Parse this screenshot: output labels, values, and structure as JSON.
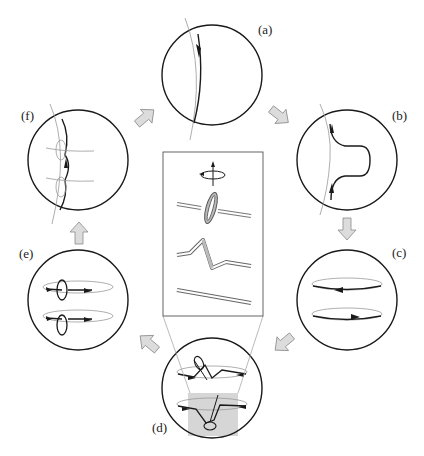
{
  "figure": {
    "type": "cyclic-process-diagram",
    "panels": [
      {
        "id": "a",
        "label": "(a)",
        "content": "field line with upward arrow crossing circle"
      },
      {
        "id": "b",
        "label": "(b)",
        "content": "field line deformed into omega loop with arrows"
      },
      {
        "id": "c",
        "label": "(c)",
        "content": "two horizontal toroidal loops with opposite arrows"
      },
      {
        "id": "d",
        "label": "(d)",
        "content": "toroidal loops with twisted kinks; highlighted gray region"
      },
      {
        "id": "e",
        "label": "(e)",
        "content": "toroidal loops with small poloidal loops"
      },
      {
        "id": "f",
        "label": "(f)",
        "content": "regenerated poloidal field line with loops"
      }
    ],
    "flow_order": [
      "a",
      "b",
      "c",
      "d",
      "e",
      "f",
      "a"
    ],
    "inset": {
      "content": "magnified view of flux tube twisting: straight tube, kinked tube, looped tube, rotation symbol",
      "source_panel": "d"
    },
    "colors": {
      "line": "#1a1a1a",
      "thin_line": "#8a8a8a",
      "arrow_fill": "#dcdcdc",
      "arrow_stroke": "#8c8c8c",
      "highlight": "#d6d6d6"
    }
  }
}
